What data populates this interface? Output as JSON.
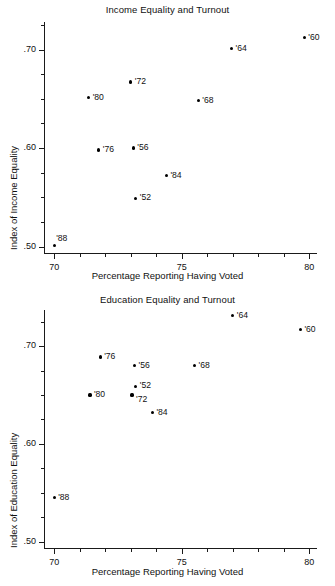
{
  "chart_data": [
    {
      "type": "scatter",
      "id": "income-equality-and-turnout",
      "title": "Income Equality and Turnout",
      "xlabel": "Percentage Reporting Having Voted",
      "ylabel": "Index of Income Equality",
      "xlim": [
        69.6,
        80.3
      ],
      "ylim": [
        0.4935,
        0.728
      ],
      "xticks": [
        70,
        75,
        80
      ],
      "xtick_labels": [
        "70",
        "75",
        "80"
      ],
      "xminor_step": 1,
      "yticks": [
        0.5,
        0.6,
        0.7
      ],
      "ytick_labels": [
        ".50",
        ".60",
        ".70"
      ],
      "yminor_step": 0.025,
      "grid": false,
      "legend": "none",
      "points": [
        {
          "label": "'60",
          "x": 79.8,
          "y": 0.712,
          "label_pos": "right"
        },
        {
          "label": "'64",
          "x": 76.95,
          "y": 0.701,
          "label_pos": "right"
        },
        {
          "label": "'72",
          "x": 73.0,
          "y": 0.667,
          "label_pos": "right"
        },
        {
          "label": "'80",
          "x": 71.35,
          "y": 0.651,
          "label_pos": "right"
        },
        {
          "label": "'68",
          "x": 75.65,
          "y": 0.648,
          "label_pos": "right"
        },
        {
          "label": "'76",
          "x": 71.75,
          "y": 0.598,
          "label_pos": "right"
        },
        {
          "label": "'56",
          "x": 73.1,
          "y": 0.6,
          "label_pos": "right"
        },
        {
          "label": "'84",
          "x": 74.4,
          "y": 0.572,
          "label_pos": "right"
        },
        {
          "label": "'52",
          "x": 73.2,
          "y": 0.549,
          "label_pos": "right"
        },
        {
          "label": "'88",
          "x": 70.0,
          "y": 0.501,
          "label_pos": "above-right"
        }
      ]
    },
    {
      "type": "scatter",
      "id": "education-equality-and-turnout",
      "title": "Education Equality and Turnout",
      "xlabel": "Percentage Reporting Having Voted",
      "ylabel": "Index of Education Equality",
      "xlim": [
        69.6,
        80.3
      ],
      "ylim": [
        0.4935,
        0.737
      ],
      "xticks": [
        70,
        75,
        80
      ],
      "xtick_labels": [
        "70",
        "75",
        "80"
      ],
      "xminor_step": 1,
      "yticks": [
        0.5,
        0.6,
        0.7
      ],
      "ytick_labels": [
        ".50",
        ".60",
        ".70"
      ],
      "yminor_step": 0.025,
      "grid": false,
      "legend": "none",
      "points": [
        {
          "label": "'64",
          "x": 77.0,
          "y": 0.731,
          "label_pos": "right"
        },
        {
          "label": "'60",
          "x": 79.65,
          "y": 0.717,
          "label_pos": "right"
        },
        {
          "label": "'76",
          "x": 71.8,
          "y": 0.689,
          "label_pos": "right"
        },
        {
          "label": "'56",
          "x": 73.15,
          "y": 0.68,
          "label_pos": "right"
        },
        {
          "label": "'68",
          "x": 75.5,
          "y": 0.68,
          "label_pos": "right"
        },
        {
          "label": "'52",
          "x": 73.2,
          "y": 0.659,
          "label_pos": "right"
        },
        {
          "label": "'80",
          "x": 71.4,
          "y": 0.65,
          "label_pos": "right"
        },
        {
          "label": "'72",
          "x": 73.05,
          "y": 0.65,
          "label_pos": "below-right"
        },
        {
          "label": "'84",
          "x": 73.85,
          "y": 0.632,
          "label_pos": "right"
        },
        {
          "label": "'88",
          "x": 70.0,
          "y": 0.545,
          "label_pos": "right"
        }
      ]
    }
  ],
  "figures": {
    "income": {
      "title": "Income Equality and Turnout",
      "xlabel": "Percentage Reporting Having Voted",
      "ylabel": "Index of Income Equality"
    },
    "education": {
      "title": "Education Equality and Turnout",
      "xlabel": "Percentage Reporting Having Voted",
      "ylabel": "Index of Education Equality"
    }
  },
  "style": {
    "axis_color": "#1a1a1a",
    "point_color": "#000000",
    "text_color": "#111111",
    "background": "#ffffff"
  }
}
